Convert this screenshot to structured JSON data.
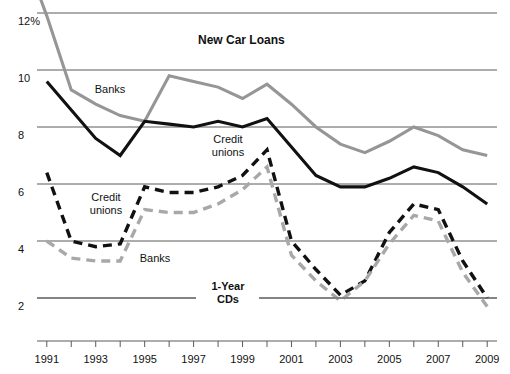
{
  "chart_data": {
    "type": "line",
    "title": "New Car Loans",
    "xlabel": "",
    "ylabel": "",
    "ylim": [
      1,
      12.6
    ],
    "xlim": [
      1990.6,
      2009.4
    ],
    "grid": true,
    "y_ticks": [
      "2",
      "4",
      "6",
      "8",
      "10",
      "12%"
    ],
    "y_tick_values": [
      2,
      4,
      6,
      8,
      10,
      12
    ],
    "x_ticks": [
      "1991",
      "1993",
      "1995",
      "1997",
      "1999",
      "2001",
      "2003",
      "2005",
      "2007",
      "2009"
    ],
    "x_tick_values": [
      1991,
      1993,
      1995,
      1997,
      1999,
      2001,
      2003,
      2005,
      2007,
      2009
    ],
    "x_all_years": [
      1991,
      1992,
      1993,
      1994,
      1995,
      1996,
      1997,
      1998,
      1999,
      2000,
      2001,
      2002,
      2003,
      2004,
      2005,
      2006,
      2007,
      2008,
      2009
    ],
    "legend_position": "inline-annotations",
    "series": [
      {
        "name": "New Car Loans - Banks",
        "group": "New Car Loans",
        "label": "Banks",
        "color": "#969696",
        "style": "solid",
        "x": [
          1990.7,
          1991,
          1992,
          1993,
          1994,
          1995,
          1996,
          1997,
          1998,
          1999,
          2000,
          2001,
          2002,
          2003,
          2004,
          2005,
          2006,
          2007,
          2008,
          2009
        ],
        "values": [
          12.6,
          11.9,
          9.3,
          8.8,
          8.4,
          8.2,
          9.8,
          9.6,
          9.4,
          9.0,
          9.5,
          8.8,
          8.0,
          7.4,
          7.1,
          7.5,
          8.0,
          7.7,
          7.2,
          7.0
        ]
      },
      {
        "name": "New Car Loans - Credit unions",
        "group": "New Car Loans",
        "label": "Credit unions",
        "color": "#111111",
        "style": "solid",
        "x": [
          1991,
          1992,
          1993,
          1994,
          1995,
          1996,
          1997,
          1998,
          1999,
          2000,
          2001,
          2002,
          2003,
          2004,
          2005,
          2006,
          2007,
          2008,
          2009
        ],
        "values": [
          9.6,
          8.6,
          7.6,
          7.0,
          8.2,
          8.1,
          8.0,
          8.2,
          8.0,
          8.3,
          7.3,
          6.3,
          5.9,
          5.9,
          6.2,
          6.6,
          6.4,
          5.9,
          5.3
        ]
      },
      {
        "name": "1-Year CDs - Credit unions",
        "group": "1-Year CDs",
        "label": "Credit unions",
        "color": "#111111",
        "style": "dashed",
        "x": [
          1991,
          1992,
          1993,
          1994,
          1995,
          1996,
          1997,
          1998,
          1999,
          2000,
          2001,
          2002,
          2003,
          2004,
          2005,
          2006,
          2007,
          2008,
          2009
        ],
        "values": [
          6.4,
          4.0,
          3.8,
          3.9,
          5.9,
          5.7,
          5.7,
          5.9,
          6.3,
          7.2,
          4.0,
          3.0,
          2.1,
          2.6,
          4.3,
          5.3,
          5.1,
          3.3,
          2.0
        ]
      },
      {
        "name": "1-Year CDs - Banks",
        "group": "1-Year CDs",
        "label": "Banks",
        "color": "#a8a8a8",
        "style": "dashed",
        "x": [
          1991,
          1992,
          1993,
          1994,
          1995,
          1996,
          1997,
          1998,
          1999,
          2000,
          2001,
          2002,
          2003,
          2004,
          2005,
          2006,
          2007,
          2008,
          2009
        ],
        "values": [
          4.0,
          3.4,
          3.3,
          3.3,
          5.1,
          5.0,
          5.0,
          5.3,
          5.8,
          6.6,
          3.5,
          2.6,
          1.9,
          2.6,
          3.9,
          4.9,
          4.7,
          2.9,
          1.7
        ]
      }
    ],
    "annotations": [
      {
        "text": "New Car Loans",
        "bold": true,
        "x": 254,
        "y": 40
      },
      {
        "text": "Banks",
        "bold": false,
        "x": 110,
        "y": 89
      },
      {
        "text": "Credit\nunions",
        "bold": false,
        "x": 228,
        "y": 145
      },
      {
        "text": "Credit\nunions",
        "bold": false,
        "x": 106,
        "y": 203
      },
      {
        "text": "Banks",
        "bold": false,
        "x": 155,
        "y": 258
      },
      {
        "text": "1-Year\nCDs",
        "bold": true,
        "x": 228,
        "y": 291
      }
    ]
  },
  "axis": {
    "y_label_top": "12%",
    "y_labels": [
      "12%",
      "10",
      "8",
      "6",
      "4",
      "2"
    ],
    "x_labels": [
      "1991",
      "1993",
      "1995",
      "1997",
      "1999",
      "2001",
      "2003",
      "2005",
      "2007",
      "2009"
    ]
  },
  "colors": {
    "grid": "#5a5a5a",
    "banks_loans": "#969696",
    "credit_unions_loans": "#111111",
    "credit_unions_cds": "#111111",
    "banks_cds": "#a8a8a8",
    "background": "#ffffff",
    "text": "#111111"
  },
  "labels": {
    "title": "New Car Loans",
    "cds_title": "1-Year CDs",
    "banks": "Banks",
    "credit_unions_line1": "Credit",
    "credit_unions_line2": "unions",
    "cds_line1": "1-Year",
    "cds_line2": "CDs"
  }
}
